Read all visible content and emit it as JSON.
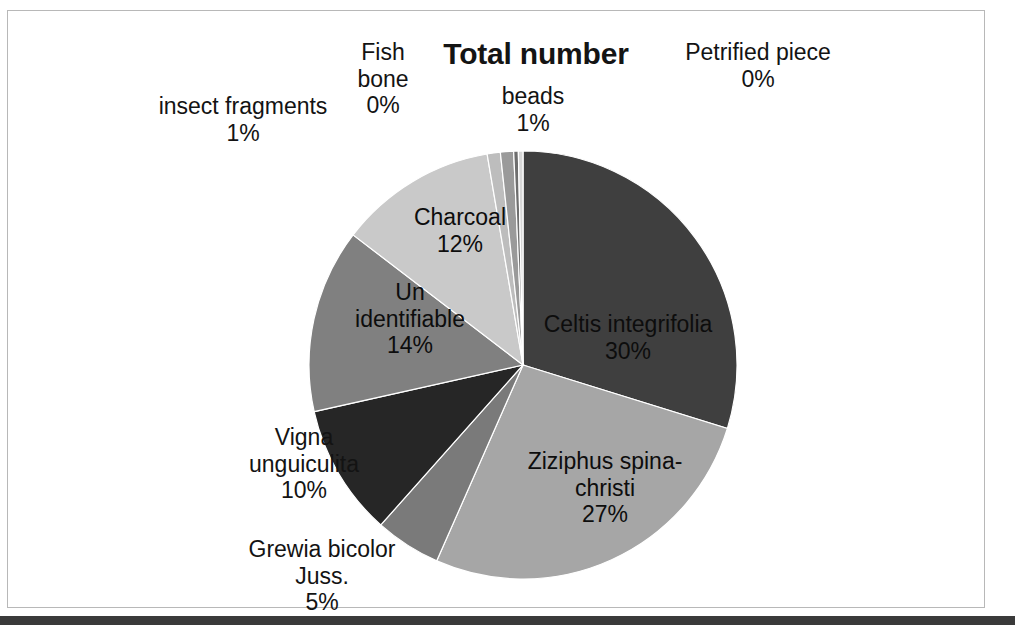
{
  "chart": {
    "title": "Total number",
    "background_color": "#ffffff",
    "frame_color": "#b8b8b8"
  },
  "labels": {
    "insect": "insect fragments\n1%",
    "fishbone": "Fish\nbone\n0%",
    "beads": "beads\n1%",
    "petrified": "Petrified piece\n0%",
    "charcoal": "Charcoal\n12%",
    "unidentifiable": "Un\nidentifiable\n14%",
    "vigna": "Vigna\nunguiculita\n10%",
    "grewia": "Grewia bicolor\nJuss.\n5%",
    "ziziphus": "Ziziphus spina-\nchristi\n27%",
    "celtis": "Celtis integrifolia\n30%"
  },
  "chart_data": {
    "type": "pie",
    "title": "Total number",
    "legend": "none",
    "labels_position": "inside-and-outside",
    "start_angle_deg": 0,
    "direction": "clockwise",
    "categories": [
      "Celtis integrifolia",
      "Ziziphus spina-christi",
      "Grewia bicolor Juss.",
      "Vigna unguiculita",
      "Un identifiable",
      "Charcoal",
      "beads",
      "insect fragments",
      "Fish bone",
      "Petrified piece"
    ],
    "values": [
      30,
      27,
      5,
      10,
      14,
      12,
      1,
      1,
      0,
      0
    ],
    "value_labels": [
      "30%",
      "27%",
      "5%",
      "10%",
      "14%",
      "12%",
      "1%",
      "1%",
      "0%",
      "0%"
    ],
    "units": "percent",
    "colors": [
      "#3f3f3f",
      "#a6a6a6",
      "#7a7a7a",
      "#262626",
      "#808080",
      "#c9c9c9",
      "#bdbdbd",
      "#9a9a9a",
      "#6e6e6e",
      "#d6d6d6"
    ]
  }
}
